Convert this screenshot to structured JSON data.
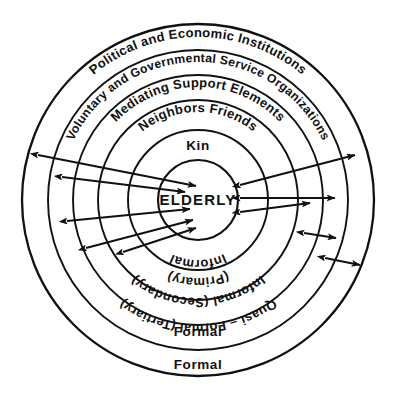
{
  "diagram": {
    "title_center": "ELDERLY",
    "rings": [
      {
        "index": 0,
        "name": "political-economic-institutions",
        "label": "Political and Economic Institutions",
        "radius": 176,
        "curved": true,
        "arc_radius": 163,
        "font_size": 13
      },
      {
        "index": 1,
        "name": "voluntary-governmental-service-organizations",
        "label": "Voluntary and Governmental Service Organizations",
        "radius": 150,
        "curved": true,
        "arc_radius": 138,
        "font_size": 12.2
      },
      {
        "index": 2,
        "name": "mediating-support-elements",
        "label": "Mediating Support Elements",
        "radius": 125,
        "curved": true,
        "arc_radius": 113,
        "font_size": 13
      },
      {
        "index": 3,
        "name": "neighbors-friends",
        "label": "Neighbors Friends",
        "radius": 100,
        "curved": true,
        "arc_radius": 88,
        "font_size": 13
      },
      {
        "index": 4,
        "name": "kin",
        "label": "Kin",
        "radius": 70,
        "curved": false,
        "font_size": 13.5
      },
      {
        "index": 5,
        "name": "elderly-core",
        "label": "ELDERLY",
        "radius": 40,
        "curved": false,
        "font_size": 15
      }
    ],
    "lower_labels": [
      {
        "name": "informal-primary-line1",
        "label": "Informal",
        "arc_radius": 60,
        "font_size": 13
      },
      {
        "name": "informal-primary-line2",
        "label": "(Primary)",
        "arc_radius": 78,
        "font_size": 13
      },
      {
        "name": "informal-secondary",
        "label": "Informal (Secondary)",
        "arc_radius": 98,
        "font_size": 13
      },
      {
        "name": "quasi-formal-tertiary",
        "label": "Quasi – Formal (Tertiary)",
        "arc_radius": 124,
        "font_size": 13
      },
      {
        "name": "formal-outer-mid",
        "label": "Formal",
        "arc_radius": 148,
        "font_size": 13.5,
        "flat": true
      },
      {
        "name": "formal-outer",
        "label": "Formal",
        "arc_radius": 172,
        "font_size": 13.5,
        "flat": true
      }
    ],
    "center": {
      "x": 198,
      "y": 200
    },
    "colors": {
      "stroke": "#111111",
      "background": "#ffffff",
      "text": "#111111"
    },
    "arrows": {
      "description": "bidirectional exchange arrows between elderly core and outer support rings",
      "left": [
        {
          "name": "arrow-left-outer",
          "x1": 38,
          "y1": 155,
          "x2": 196,
          "y2": 186,
          "heads": "both"
        },
        {
          "name": "arrow-left-upper",
          "x1": 62,
          "y1": 177,
          "x2": 185,
          "y2": 192,
          "heads": "both"
        },
        {
          "name": "arrow-left-lower",
          "x1": 67,
          "y1": 221,
          "x2": 190,
          "y2": 209,
          "heads": "both"
        },
        {
          "name": "arrow-left-bottom",
          "x1": 86,
          "y1": 248,
          "x2": 193,
          "y2": 220,
          "heads": "both"
        },
        {
          "name": "arrow-left-diagonal",
          "x1": 123,
          "y1": 252,
          "x2": 196,
          "y2": 228,
          "heads": "both"
        }
      ],
      "right": [
        {
          "name": "arrow-right-outer",
          "x1": 240,
          "y1": 185,
          "x2": 355,
          "y2": 155,
          "heads": "both"
        },
        {
          "name": "arrow-right-mid",
          "x1": 240,
          "y1": 198,
          "x2": 335,
          "y2": 198,
          "heads": "both"
        },
        {
          "name": "arrow-right-lower",
          "x1": 240,
          "y1": 212,
          "x2": 310,
          "y2": 203,
          "heads": "both"
        },
        {
          "name": "arrow-right-short-1",
          "x1": 304,
          "y1": 233,
          "x2": 336,
          "y2": 238,
          "heads": "both"
        },
        {
          "name": "arrow-right-short-2",
          "x1": 325,
          "y1": 258,
          "x2": 360,
          "y2": 265,
          "heads": "both"
        }
      ]
    }
  }
}
